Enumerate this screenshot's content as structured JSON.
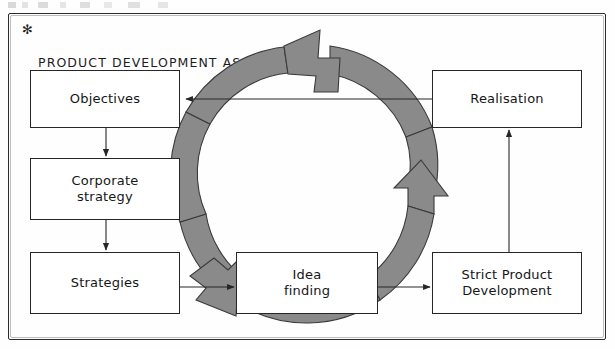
{
  "diagram": {
    "title_marker": "✻",
    "title": "PRODUCT DEVELOPMENT AS A\nCYCLIC ACTIVITY",
    "ring_color": "#8a8a8a",
    "ring_outline_color": "#3a3a3a",
    "line_color": "#262626",
    "boxes": [
      {
        "id": "objectives",
        "label": "Objectives"
      },
      {
        "id": "corporate",
        "label": "Corporate\nstrategy"
      },
      {
        "id": "strategies",
        "label": "Strategies"
      },
      {
        "id": "idea",
        "label": "Idea\nfinding"
      },
      {
        "id": "strict",
        "label": "Strict Product\nDevelopment"
      },
      {
        "id": "realisation",
        "label": "Realisation"
      }
    ],
    "connectors": [
      {
        "from": "objectives",
        "to": "corporate",
        "direction": "down"
      },
      {
        "from": "corporate",
        "to": "strategies",
        "direction": "down"
      },
      {
        "from": "strategies",
        "to": "idea",
        "direction": "right"
      },
      {
        "from": "idea",
        "to": "strict",
        "direction": "right"
      },
      {
        "from": "strict",
        "to": "realisation",
        "direction": "up"
      },
      {
        "from": "realisation",
        "to": "objectives",
        "direction": "left"
      }
    ],
    "cycle_arrowheads": [
      "top-pointing-left",
      "right-pointing-up",
      "bottom-left-pointing-down"
    ]
  }
}
